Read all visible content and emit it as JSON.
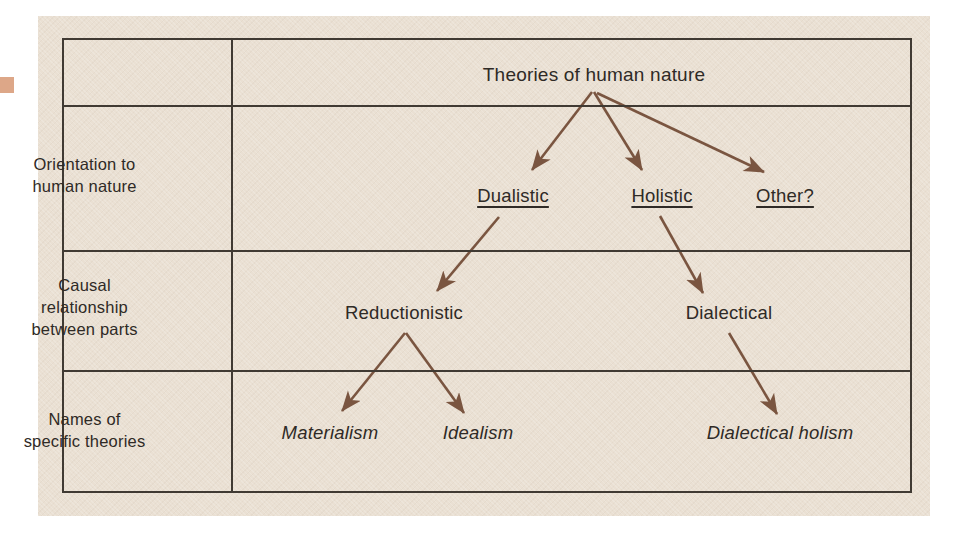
{
  "figure": {
    "title_node": "Theories of human nature",
    "accent_arrow_color": "#7a5540",
    "border_color": "#403a33",
    "paper_color": "#eae0d3",
    "text_color": "#2f2a26"
  },
  "rows": [
    {
      "label": "",
      "cells": [
        "Theories of human nature"
      ]
    },
    {
      "label": "Orientation to\nhuman nature",
      "cells": [
        "Dualistic",
        "Holistic",
        "Other?"
      ]
    },
    {
      "label": "Causal\nrelationship\nbetween parts",
      "cells": [
        "Reductionistic",
        "Dialectical"
      ]
    },
    {
      "label": "Names of\nspecific theories",
      "cells": [
        "Materialism",
        "Idealism",
        "Dialectical holism"
      ]
    }
  ],
  "row_labels": {
    "row1_line1": "Orientation to",
    "row1_line2": "human nature",
    "row2_line1": "Causal",
    "row2_line2": "relationship",
    "row2_line3": "between parts",
    "row3_line1": "Names of",
    "row3_line2": "specific theories"
  },
  "nodes": {
    "root": "Theories of human nature",
    "orientation_dualistic": "Dualistic",
    "orientation_holistic": "Holistic",
    "orientation_other": "Other?",
    "causal_reductionistic": "Reductionistic",
    "causal_dialectical": "Dialectical",
    "theory_materialism": "Materialism",
    "theory_idealism": "Idealism",
    "theory_dialectical_holism": "Dialectical holism"
  },
  "edges": [
    {
      "from": "root",
      "to": "orientation_dualistic"
    },
    {
      "from": "root",
      "to": "orientation_holistic"
    },
    {
      "from": "root",
      "to": "orientation_other"
    },
    {
      "from": "orientation_dualistic",
      "to": "causal_reductionistic"
    },
    {
      "from": "orientation_holistic",
      "to": "causal_dialectical"
    },
    {
      "from": "causal_reductionistic",
      "to": "theory_materialism"
    },
    {
      "from": "causal_reductionistic",
      "to": "theory_idealism"
    },
    {
      "from": "causal_dialectical",
      "to": "theory_dialectical_holism"
    }
  ]
}
